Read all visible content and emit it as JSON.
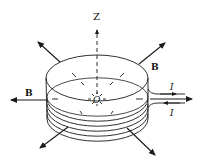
{
  "diagram": {
    "labels": {
      "z_axis": "Z",
      "origin": "O",
      "field_upper_right": "B",
      "field_left": "B",
      "current_in": "I",
      "current_out": "I"
    },
    "colors": {
      "stroke": "#1a1a1a",
      "background": "#ffffff"
    },
    "arrows": [
      {
        "name": "field-arrow-upper-left",
        "label": ""
      },
      {
        "name": "field-arrow-upper-right",
        "label": "B"
      },
      {
        "name": "field-arrow-left",
        "label": "B"
      },
      {
        "name": "field-arrow-lower-left",
        "label": ""
      },
      {
        "name": "field-arrow-lower-right",
        "label": ""
      },
      {
        "name": "lead-arrow-right",
        "label": ""
      }
    ],
    "coil_turns": 5
  }
}
